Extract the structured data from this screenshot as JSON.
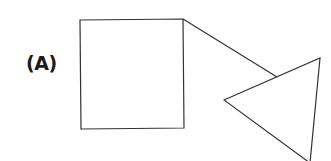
{
  "figure": {
    "label": "(A)",
    "stroke_color": "#333333",
    "shapes": [
      {
        "type": "square",
        "points": [
          [
            80,
            20
          ],
          [
            183,
            19
          ],
          [
            184,
            128
          ],
          [
            81,
            129
          ]
        ]
      },
      {
        "type": "line",
        "points": [
          [
            183,
            19
          ],
          [
            277,
            77
          ]
        ]
      },
      {
        "type": "triangle",
        "points": [
          [
            224,
            100
          ],
          [
            320,
            58
          ],
          [
            310,
            163
          ]
        ]
      }
    ]
  }
}
